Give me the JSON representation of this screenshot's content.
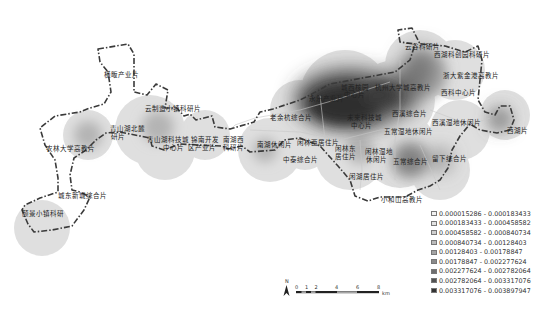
{
  "map": {
    "type": "kernel-density",
    "labels": [
      {
        "id": "l1",
        "text": "横畈产业片",
        "x": 104,
        "y": 72
      },
      {
        "id": "l2",
        "text": "云制造小镇科研片",
        "x": 145,
        "y": 106
      },
      {
        "id": "l3",
        "text": "青山湖北麓",
        "x": 110,
        "y": 126
      },
      {
        "id": "l3b",
        "text": "研片",
        "x": 111,
        "y": 134
      },
      {
        "id": "l4",
        "text": "青山湖科技城",
        "x": 147,
        "y": 137
      },
      {
        "id": "l4b",
        "text": "中心片",
        "x": 163,
        "y": 145
      },
      {
        "id": "l5",
        "text": "锦南开发",
        "x": 191,
        "y": 137
      },
      {
        "id": "l5b",
        "text": "区产业片",
        "x": 188,
        "y": 145
      },
      {
        "id": "l6",
        "text": "南湖西",
        "x": 223,
        "y": 137
      },
      {
        "id": "l6b",
        "text": "科研片",
        "x": 223,
        "y": 145
      },
      {
        "id": "l7",
        "text": "农林大学高教片",
        "x": 46,
        "y": 146
      },
      {
        "id": "l8",
        "text": "城东新城综合片",
        "x": 58,
        "y": 193
      },
      {
        "id": "l9",
        "text": "颐景小镇科研",
        "x": 22,
        "y": 211
      },
      {
        "id": "l10",
        "text": "老余杭综合片",
        "x": 270,
        "y": 115
      },
      {
        "id": "l11",
        "text": "永乐产业片",
        "x": 309,
        "y": 96
      },
      {
        "id": "l12",
        "text": "城西核园",
        "x": 341,
        "y": 85
      },
      {
        "id": "l12b",
        "text": "中心片",
        "x": 344,
        "y": 92
      },
      {
        "id": "l13",
        "text": "杭州大学城高教片",
        "x": 375,
        "y": 85
      },
      {
        "id": "l14",
        "text": "未来科技城",
        "x": 347,
        "y": 115
      },
      {
        "id": "l14b",
        "text": "中心片",
        "x": 351,
        "y": 123
      },
      {
        "id": "l15",
        "text": "西溪综合片",
        "x": 392,
        "y": 111
      },
      {
        "id": "l16",
        "text": "五常湿地休闲片",
        "x": 384,
        "y": 129
      },
      {
        "id": "l17",
        "text": "云谷科研片",
        "x": 405,
        "y": 44
      },
      {
        "id": "l18",
        "text": "西湖科创园科研片",
        "x": 434,
        "y": 52
      },
      {
        "id": "l19",
        "text": "浙大紫金港高教片",
        "x": 443,
        "y": 73
      },
      {
        "id": "l20",
        "text": "西科中心片",
        "x": 441,
        "y": 90
      },
      {
        "id": "l21",
        "text": "西溪湿地休闲片",
        "x": 432,
        "y": 120
      },
      {
        "id": "l22",
        "text": "西湖片",
        "x": 507,
        "y": 128
      },
      {
        "id": "l23",
        "text": "南湖休闲片",
        "x": 257,
        "y": 142
      },
      {
        "id": "l24",
        "text": "闲林西居住片",
        "x": 297,
        "y": 140
      },
      {
        "id": "l25",
        "text": "闲林东",
        "x": 335,
        "y": 146
      },
      {
        "id": "l25b",
        "text": "居住片",
        "x": 335,
        "y": 154
      },
      {
        "id": "l26",
        "text": "闲林湿地",
        "x": 365,
        "y": 149
      },
      {
        "id": "l26b",
        "text": "休闲片",
        "x": 366,
        "y": 157
      },
      {
        "id": "l27",
        "text": "五常综合片",
        "x": 393,
        "y": 159
      },
      {
        "id": "l28",
        "text": "留下综合片",
        "x": 432,
        "y": 156
      },
      {
        "id": "l29",
        "text": "中泰综合片",
        "x": 283,
        "y": 157
      },
      {
        "id": "l30",
        "text": "闲湖居住片",
        "x": 349,
        "y": 174
      },
      {
        "id": "l31",
        "text": "小和山高教片",
        "x": 381,
        "y": 197
      }
    ]
  },
  "legend": {
    "items": [
      {
        "label": "0.000015286 - 0.000183433",
        "color": "#f2f2f2"
      },
      {
        "label": "0.000183433 - 0.000458582",
        "color": "#e2e2e2"
      },
      {
        "label": "0.000458582 - 0.000840734",
        "color": "#cfcfcf"
      },
      {
        "label": "0.000840734 - 0.00128403",
        "color": "#bbbbbb"
      },
      {
        "label": "0.00128403 - 0.00178847",
        "color": "#a4a4a4"
      },
      {
        "label": "0.00178847 - 0.002277624",
        "color": "#8a8a8a"
      },
      {
        "label": "0.002277624 - 0.002782064",
        "color": "#6e6e6e"
      },
      {
        "label": "0.002782064 - 0.003317076",
        "color": "#525252"
      },
      {
        "label": "0.003317076 - 0.003897947",
        "color": "#333333"
      }
    ]
  },
  "north_arrow": {
    "label": "N"
  },
  "scale_bar": {
    "ticks": [
      "0",
      "1",
      "2",
      "4",
      "6",
      "8"
    ],
    "unit": "km"
  }
}
